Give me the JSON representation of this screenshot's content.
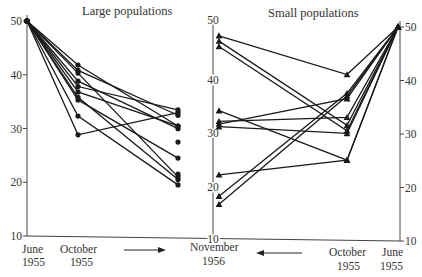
{
  "chart_data": {
    "type": "line",
    "title": "",
    "panels": [
      {
        "name": "Large populations",
        "marker": "circle",
        "x": [
          "June 1955",
          "October 1955",
          "November 1956"
        ],
        "series": [
          {
            "name": "L1",
            "values": [
              50,
              42.0,
              31.0
            ]
          },
          {
            "name": "L2",
            "values": [
              50,
              41.0,
              33.0
            ]
          },
          {
            "name": "L3",
            "values": [
              50,
              40.5,
              21.5
            ]
          },
          {
            "name": "L4",
            "values": [
              50,
              39.0,
              30.5
            ]
          },
          {
            "name": "L5",
            "values": [
              50,
              38.0,
              34.0
            ]
          },
          {
            "name": "L6",
            "values": [
              50,
              37.0,
              31.0
            ]
          },
          {
            "name": "L7",
            "values": [
              50,
              36.0,
              21.0
            ]
          },
          {
            "name": "L8",
            "values": [
              50,
              35.5,
              25.0
            ]
          },
          {
            "name": "L9",
            "values": [
              50,
              32.5,
              20.0
            ]
          },
          {
            "name": "L10",
            "values": [
              50,
              29.0,
              33.5
            ]
          }
        ],
        "extra_november_points": [
          28.0,
          22.0
        ]
      },
      {
        "name": "Small populations",
        "marker": "triangle",
        "x": [
          "November 1956",
          "October 1955",
          "June 1955"
        ],
        "series": [
          {
            "name": "S1",
            "values": [
              48.0,
              41.0,
              50
            ]
          },
          {
            "name": "S2",
            "values": [
              18.0,
              37.5,
              50
            ]
          },
          {
            "name": "S3",
            "values": [
              16.5,
              37.0,
              50
            ]
          },
          {
            "name": "S4",
            "values": [
              31.5,
              36.5,
              50
            ]
          },
          {
            "name": "S5",
            "values": [
              32.0,
              33.0,
              50
            ]
          },
          {
            "name": "S6",
            "values": [
              47.0,
              31.5,
              50
            ]
          },
          {
            "name": "S7",
            "values": [
              46.0,
              30.5,
              50
            ]
          },
          {
            "name": "S8",
            "values": [
              31.0,
              30.0,
              50
            ]
          },
          {
            "name": "S9",
            "values": [
              34.0,
              25.0,
              50
            ]
          },
          {
            "name": "S10",
            "values": [
              22.0,
              25.0,
              50
            ]
          }
        ]
      }
    ],
    "axes": {
      "ylim": [
        10,
        50
      ],
      "yticks": [
        10,
        20,
        30,
        40,
        50
      ],
      "left_axis_ticks": [
        "10",
        "20",
        "30",
        "40",
        "50"
      ],
      "middle_axis_ticks": [
        "10",
        "20",
        "30",
        "40",
        "50"
      ],
      "right_axis_ticks": [
        "10",
        "20",
        "30",
        "40",
        "50"
      ]
    },
    "grid": false,
    "legend": "none"
  },
  "labels": {
    "large_title": "Large populations",
    "small_title": "Small populations",
    "x_left_june": [
      "June",
      "1955"
    ],
    "x_left_october": [
      "October",
      "1955"
    ],
    "x_middle_november": [
      "November",
      "1956"
    ],
    "x_right_october": [
      "October",
      "1955"
    ],
    "x_right_june": [
      "June",
      "1955"
    ],
    "arrow_left_direction": "right",
    "arrow_right_direction": "left"
  },
  "colors": {
    "ink": "#1a1a1a",
    "axis": "#444444",
    "text": "#333333"
  }
}
